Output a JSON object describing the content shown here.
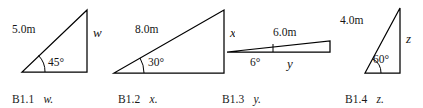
{
  "figure": {
    "background_color": "#ffffff",
    "line_color": "#000000",
    "text_color": "#151515",
    "width": 423,
    "height": 108
  },
  "panels": [
    {
      "id": "B1.1",
      "caption_id": "B1.1",
      "caption_var": "w.",
      "unknown": "w",
      "hypotenuse_label": "5.0m",
      "angle_label": "45°",
      "angle_degrees": 45,
      "hypotenuse_meters": 5.0,
      "unknown_side": "opposite-vertical",
      "shape": "right-triangle"
    },
    {
      "id": "B1.2",
      "caption_id": "B1.2",
      "caption_var": "x.",
      "unknown": "x",
      "hypotenuse_label": "8.0m",
      "angle_label": "30°",
      "angle_degrees": 30,
      "hypotenuse_meters": 8.0,
      "unknown_side": "opposite-vertical",
      "shape": "right-triangle"
    },
    {
      "id": "B1.3",
      "caption_id": "B1.3",
      "caption_var": "y.",
      "unknown": "y",
      "hypotenuse_label": "6.0m",
      "angle_label": "6°",
      "angle_degrees": 6,
      "hypotenuse_meters": 6.0,
      "unknown_side": "adjacent-horizontal",
      "shape": "right-triangle"
    },
    {
      "id": "B1.4",
      "caption_id": "B1.4",
      "caption_var": "z.",
      "unknown": "z",
      "hypotenuse_label": "4.0m",
      "angle_label": "60°",
      "angle_degrees": 60,
      "hypotenuse_meters": 4.0,
      "unknown_side": "opposite-vertical",
      "shape": "right-triangle"
    }
  ]
}
